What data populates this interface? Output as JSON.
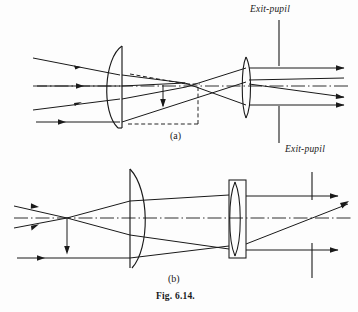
{
  "figure": {
    "caption": "Fig. 6.14.",
    "panels": [
      {
        "id": "a",
        "label": "(a)",
        "exit_pupil_label": "Exit-pupil",
        "description": "Ray diagram: plano-convex objective forming an inverted intermediate image, relayed by an eye lens to an exit-pupil.",
        "elements": {
          "optical_axis": "dash-dot chain line",
          "objective_lens": "plano-convex, convex side facing left",
          "eye_lens": "thin biconvex lens",
          "intermediate_image": "downward arrow with dashed construction rectangle",
          "exit_pupil": "vertical line segments above and below axis"
        }
      },
      {
        "id": "b",
        "label": "(b)",
        "exit_pupil_label": "Exit-pupil",
        "description": "Ray diagram: rays cross ahead of a plano-convex lens, pass through a mounted biconvex eye lens to an exit-pupil.",
        "elements": {
          "optical_axis": "dash-dot chain line",
          "objective_lens": "plano-convex, flat side facing left",
          "eye_lens": "biconvex lens in rectangular mount",
          "object_arrow": "downward arrow at crossing point",
          "exit_pupil": "vertical line segments above and below axis"
        }
      }
    ]
  },
  "style": {
    "ink_color": "#1a1a1a",
    "paper_color": "#fdfdfd",
    "line_width": 1.0
  }
}
